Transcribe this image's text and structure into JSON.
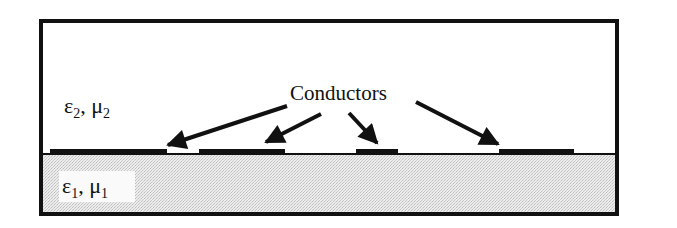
{
  "diagram": {
    "type": "cross-section",
    "upper_region": {
      "label_eps": "ε",
      "label_eps_sub": "2",
      "label_sep": ", ",
      "label_mu": "μ",
      "label_mu_sub": "2"
    },
    "lower_region": {
      "label_eps": "ε",
      "label_eps_sub": "1",
      "label_sep": ", ",
      "label_mu": "μ",
      "label_mu_sub": "1",
      "fill": "stippled gray"
    },
    "callout": {
      "label": "Conductors"
    },
    "conductors": [
      {
        "id": 1,
        "x1": 50,
        "x2": 167
      },
      {
        "id": 2,
        "x1": 199,
        "x2": 285
      },
      {
        "id": 3,
        "x1": 356,
        "x2": 398
      },
      {
        "id": 4,
        "x1": 499,
        "x2": 574
      }
    ],
    "colors": {
      "stroke": "#111111",
      "substrate": "#e2e2e2",
      "background": "#ffffff"
    }
  }
}
